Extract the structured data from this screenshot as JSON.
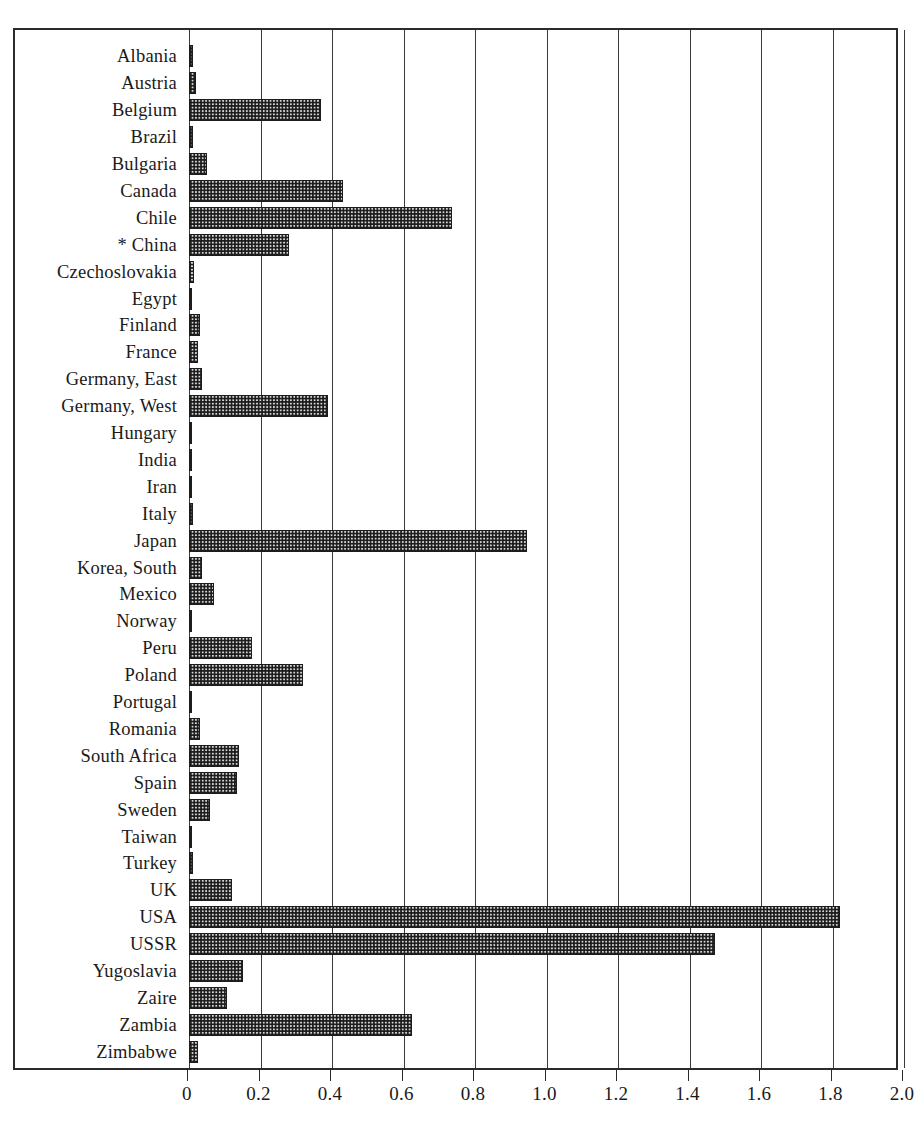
{
  "figure": {
    "title_remnant": "",
    "background": "#ffffff",
    "frame_color": "#2b2b2b",
    "bar_fill": "#d8d8d8",
    "bar_border": "#1c1c1c",
    "footnote_marker": "*"
  },
  "axis": {
    "x_min": 0,
    "x_max": 2.0,
    "x_step": 0.2,
    "x_tick_labels": [
      "0",
      "0.2",
      "0.4",
      "0.6",
      "0.8",
      "1.0",
      "1.2",
      "1.4",
      "1.6",
      "1.8",
      "2.0"
    ],
    "x_tick_values": [
      0,
      0.2,
      0.4,
      0.6,
      0.8,
      1.0,
      1.2,
      1.4,
      1.6,
      1.8,
      2.0
    ],
    "xlabel": "",
    "ylabel": "",
    "grid": true,
    "grid_orientation": "vertical"
  },
  "chart_data": {
    "type": "bar",
    "orientation": "horizontal",
    "title": "",
    "subtitle": "",
    "xlabel": "",
    "ylabel": "",
    "xlim": [
      0,
      2.0
    ],
    "grid": true,
    "legend": null,
    "annotations": [
      "* China"
    ],
    "categories": [
      "Albania",
      "Austria",
      "Belgium",
      "Brazil",
      "Bulgaria",
      "Canada",
      "Chile",
      "* China",
      "Czechoslovakia",
      "Egypt",
      "Finland",
      "France",
      "Germany, East",
      "Germany, West",
      "Hungary",
      "India",
      "Iran",
      "Italy",
      "Japan",
      "Korea, South",
      "Mexico",
      "Norway",
      "Peru",
      "Poland",
      "Portugal",
      "Romania",
      "South Africa",
      "Spain",
      "Sweden",
      "Taiwan",
      "Turkey",
      "UK",
      "USA",
      "USSR",
      "Yugoslavia",
      "Zaire",
      "Zambia",
      "Zimbabwe"
    ],
    "values": [
      0.01,
      0.02,
      0.37,
      0.01,
      0.05,
      0.43,
      0.735,
      0.28,
      0.015,
      0.005,
      0.03,
      0.025,
      0.035,
      0.39,
      0.008,
      0.004,
      0.004,
      0.012,
      0.945,
      0.035,
      0.07,
      0.008,
      0.175,
      0.32,
      0.003,
      0.03,
      0.14,
      0.135,
      0.06,
      0.005,
      0.012,
      0.12,
      1.82,
      1.47,
      0.15,
      0.105,
      0.625,
      0.025
    ]
  }
}
